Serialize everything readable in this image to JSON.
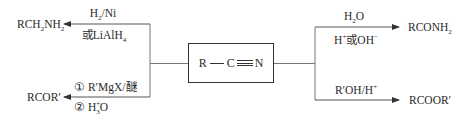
{
  "center": {
    "label": "R—C≡N",
    "parts": {
      "r": "R",
      "c": "C",
      "n": "N"
    }
  },
  "reactions": {
    "reduction": {
      "product": {
        "main": "RCH",
        "sub1": "2",
        "mid": "NH",
        "sub2": "2"
      },
      "reagent_top": {
        "main": "H",
        "sub": "2",
        "rest": "/Ni"
      },
      "reagent_bottom": {
        "prefix": "或",
        "main": "LiAlH",
        "sub": "4"
      },
      "direction": "left"
    },
    "grignard": {
      "product": "RCOR′",
      "step1": {
        "num": "①",
        "text": "R′MgX/醚"
      },
      "step2": {
        "num": "②",
        "main": "H",
        "sub": "3",
        "sup": "+",
        "rest": "O"
      },
      "direction": "left"
    },
    "hydrolysis": {
      "product": {
        "main": "RCONH",
        "sub": "2"
      },
      "reagent_top": {
        "main": "H",
        "sub": "2",
        "rest": "O"
      },
      "reagent_bottom": {
        "h": "H",
        "hsup": "+",
        "mid": "或OH",
        "ohsup": "−"
      },
      "direction": "right"
    },
    "alcoholysis": {
      "product": "RCOOR′",
      "reagent": {
        "main": "R′OH/H",
        "sup": "+"
      },
      "direction": "right"
    }
  },
  "colors": {
    "line": "#555555",
    "text": "#2a2a2a",
    "background": "#ffffff"
  }
}
